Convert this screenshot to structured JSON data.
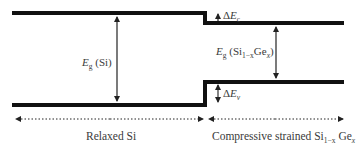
{
  "figure": {
    "colors": {
      "band_line": "#111111",
      "arrow": "#333333",
      "text": "#3a3a3a"
    }
  },
  "bands": {
    "relaxed_si": {
      "conduction_band_y": 13,
      "valence_band_y": 105
    },
    "strained_sige": {
      "conduction_band_y": 23,
      "valence_band_y": 82
    }
  },
  "labels": {
    "eg_si": {
      "symbol": "E",
      "sub": "g",
      "text": " (Si)"
    },
    "eg_sige": {
      "symbol": "E",
      "sub": "g",
      "pre": " (Si",
      "sub1": "1−x",
      "mid": "Ge",
      "sub2": "x",
      "post": ")"
    },
    "delta_ec": {
      "delta": "Δ",
      "symbol": "E",
      "sub": "c"
    },
    "delta_ev": {
      "delta": "Δ",
      "symbol": "E",
      "sub": "v"
    }
  },
  "regions": {
    "left": {
      "text": "Relaxed Si"
    },
    "right": {
      "pre": "Compressive strained Si",
      "sub1": "1−x",
      "mid": " Ge",
      "sub2": "x"
    }
  }
}
